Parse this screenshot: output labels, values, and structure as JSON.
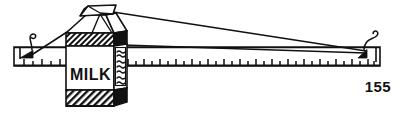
{
  "figure": {
    "caption_number": "155",
    "carton_front_label": "MILK",
    "carton_side_label_lines": [
      "~~~~",
      "~~~~",
      "~~~~",
      "~~~~",
      "~~~~"
    ],
    "line_color": "#111111",
    "fill_black": "#111111",
    "fill_white": "#ffffff",
    "background": "#ffffff",
    "parts": [
      {
        "name": "ruler-beam",
        "label": "ruler"
      },
      {
        "name": "left-hook",
        "label": "left hook"
      },
      {
        "name": "right-hook",
        "label": "right hook"
      },
      {
        "name": "milk-carton",
        "label": "milk carton"
      },
      {
        "name": "suspension-string-left",
        "label": "left string"
      },
      {
        "name": "suspension-string-right-upper",
        "label": "right upper string"
      },
      {
        "name": "suspension-string-right-lower",
        "label": "right lower string"
      }
    ],
    "ruler_tick_count": 34
  }
}
